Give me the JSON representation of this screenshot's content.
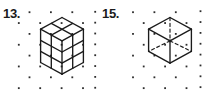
{
  "page": {
    "background": "#ffffff",
    "ink": "#1b1b1b",
    "dot_color": "#2d2d2d"
  },
  "figures": [
    {
      "id": "figure-13",
      "label": "13.",
      "description": "Isometric drawing of a 2x2x3 rectangular prism built from unit cubes on isometric dot paper",
      "dot_patch": {
        "y0": 12.2,
        "dy": 10.85,
        "rows": 8,
        "even_row_x": [
          29.5,
          50.9,
          72.3
        ],
        "odd_row_x": [
          18.8,
          40.2,
          61.6,
          83.0
        ],
        "edge_col": {
          "x": 95.2,
          "y0": 11.8,
          "dy": 10.85,
          "count": 8
        }
      },
      "solid_segments": [
        [
          62.0,
          17.5,
          40.6,
          29.2
        ],
        [
          40.6,
          29.2,
          40.6,
          62.5
        ],
        [
          40.6,
          62.5,
          62.0,
          74.2
        ],
        [
          62.0,
          74.2,
          83.4,
          62.5
        ],
        [
          83.4,
          62.5,
          83.4,
          29.2
        ],
        [
          83.4,
          29.2,
          62.0,
          17.5
        ],
        [
          40.6,
          29.2,
          62.0,
          40.9
        ],
        [
          62.0,
          40.9,
          83.4,
          29.2
        ],
        [
          51.3,
          23.4,
          72.7,
          35.1
        ],
        [
          72.7,
          23.4,
          51.3,
          35.1
        ],
        [
          62.0,
          40.9,
          62.0,
          74.2
        ],
        [
          51.3,
          35.1,
          51.3,
          68.4
        ],
        [
          72.7,
          35.1,
          72.7,
          68.4
        ],
        [
          40.6,
          40.3,
          62.0,
          52.0
        ],
        [
          40.6,
          51.4,
          62.0,
          63.1
        ],
        [
          62.0,
          52.0,
          83.4,
          40.3
        ],
        [
          62.0,
          63.1,
          83.4,
          51.4
        ]
      ],
      "dashed_segments": [],
      "nodes": []
    },
    {
      "id": "figure-15",
      "label": "15.",
      "description": "Isometric drawing of a cube with hidden back edges shown dashed on isometric dot paper",
      "dot_patch": {
        "y0": 12.2,
        "dy": 10.85,
        "rows": 8,
        "even_row_x": [
          133.0,
          154.4,
          175.8
        ],
        "odd_row_x": [
          143.7,
          165.1,
          186.5
        ],
        "edge_col": {
          "x": 200.5,
          "y0": 11.2,
          "dy": 10.85,
          "count": 8
        }
      },
      "solid_segments": [
        [
          170.0,
          17.5,
          148.6,
          29.2
        ],
        [
          148.6,
          29.2,
          148.6,
          51.4
        ],
        [
          148.6,
          51.4,
          170.0,
          63.1
        ],
        [
          170.0,
          63.1,
          191.4,
          51.4
        ],
        [
          191.4,
          51.4,
          191.4,
          29.2
        ],
        [
          191.4,
          29.2,
          170.0,
          17.5
        ],
        [
          148.6,
          29.2,
          170.0,
          40.9
        ],
        [
          170.0,
          40.9,
          191.4,
          29.2
        ],
        [
          170.0,
          40.9,
          170.0,
          63.1
        ]
      ],
      "dashed_segments": [
        [
          170.0,
          17.5,
          170.0,
          40.9
        ],
        [
          170.0,
          40.9,
          148.6,
          51.4
        ],
        [
          170.0,
          40.9,
          191.4,
          51.4
        ]
      ],
      "nodes": [
        [
          170.0,
          40.9
        ]
      ]
    }
  ]
}
